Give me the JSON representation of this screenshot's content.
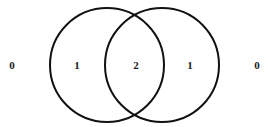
{
  "figure": {
    "type": "venn-2",
    "background_color": "#ffffff",
    "stroke_color": "#111111",
    "stroke_width": 2,
    "text_color": "#1a1a1a",
    "canvas": {
      "width": 269,
      "height": 127
    }
  },
  "circles": [
    {
      "name": "left-set",
      "cx": 107,
      "cy": 65,
      "r": 57
    },
    {
      "name": "right-set",
      "cx": 162,
      "cy": 65,
      "r": 57
    }
  ],
  "regions": [
    {
      "key": "outside-left",
      "label": "0",
      "x": 12,
      "y": 65
    },
    {
      "key": "left-only",
      "label": "1",
      "x": 77,
      "y": 65
    },
    {
      "key": "intersection",
      "label": "2",
      "x": 136,
      "y": 65
    },
    {
      "key": "right-only",
      "label": "1",
      "x": 190,
      "y": 65
    },
    {
      "key": "outside-right",
      "label": "0",
      "x": 257,
      "y": 65
    }
  ],
  "chart_data": {
    "type": "venn",
    "title": "",
    "sets": [
      "Left",
      "Right"
    ],
    "region_counts": {
      "outside": 0,
      "left_only": 1,
      "intersection": 2,
      "right_only": 1
    },
    "labels": [
      "0",
      "1",
      "2",
      "1",
      "0"
    ],
    "legend": "none",
    "grid": false
  }
}
